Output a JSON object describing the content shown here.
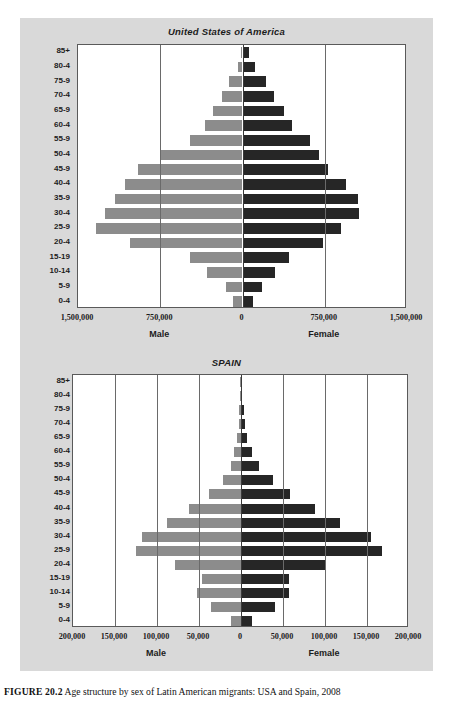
{
  "caption": {
    "label": "FIGURE 20.2",
    "text": "Age structure by sex of Latin American migrants: USA and Spain, 2008"
  },
  "colors": {
    "male_bar": "#8c8c8c",
    "female_bar": "#262626",
    "panel_background": "#d9d9d9",
    "plot_background": "#ffffff",
    "gridline": "#6a6a6a"
  },
  "chart_data": [
    {
      "type": "bar",
      "subtype": "population-pyramid",
      "title": "United States of America",
      "xlabel": "",
      "ylabel": "",
      "grid": true,
      "legend_position": "below-axis",
      "categories": [
        "85+",
        "80-4",
        "75-9",
        "70-4",
        "65-9",
        "60-4",
        "55-9",
        "50-4",
        "45-9",
        "40-4",
        "35-9",
        "30-4",
        "25-9",
        "20-4",
        "15-19",
        "10-14",
        "5-9",
        "0-4"
      ],
      "xtick_labels": [
        "1,500,000",
        "750,000",
        "0",
        "750,000",
        "1,500,000"
      ],
      "xtick_values": [
        1500000,
        750000,
        0,
        750000,
        1500000
      ],
      "xlim": [
        -1500000,
        1500000
      ],
      "series": [
        {
          "name": "Male",
          "color": "#8c8c8c",
          "side": "left",
          "values": [
            18000,
            45000,
            120000,
            185000,
            265000,
            345000,
            480000,
            740000,
            950000,
            1070000,
            1160000,
            1250000,
            1340000,
            1030000,
            480000,
            320000,
            150000,
            85000
          ]
        },
        {
          "name": "Female",
          "color": "#262626",
          "side": "right",
          "values": [
            60000,
            110000,
            210000,
            290000,
            380000,
            450000,
            620000,
            700000,
            780000,
            940000,
            1050000,
            1060000,
            900000,
            730000,
            420000,
            300000,
            175000,
            95000
          ]
        }
      ]
    },
    {
      "type": "bar",
      "subtype": "population-pyramid",
      "title": "SPAIN",
      "xlabel": "",
      "ylabel": "",
      "grid": true,
      "legend_position": "below-axis",
      "categories": [
        "85+",
        "80-4",
        "75-9",
        "70-4",
        "65-9",
        "60-4",
        "55-9",
        "50-4",
        "45-9",
        "40-4",
        "35-9",
        "30-4",
        "25-9",
        "20-4",
        "15-19",
        "10-14",
        "5-9",
        "0-4"
      ],
      "xtick_labels": [
        "200,000",
        "150,000",
        "100,000",
        "50,000",
        "0",
        "50,000",
        "100,000",
        "150,000",
        "200,000"
      ],
      "xtick_values": [
        200000,
        150000,
        100000,
        50000,
        0,
        50000,
        100000,
        150000,
        200000
      ],
      "xlim": [
        -200000,
        200000
      ],
      "series": [
        {
          "name": "Male",
          "color": "#8c8c8c",
          "side": "left",
          "values": [
            400,
            900,
            1800,
            2800,
            4200,
            8000,
            12000,
            22000,
            38000,
            62000,
            88000,
            118000,
            125000,
            78000,
            47000,
            52000,
            36000,
            12000
          ]
        },
        {
          "name": "Female",
          "color": "#262626",
          "side": "right",
          "values": [
            700,
            1400,
            3000,
            4500,
            7500,
            13000,
            22000,
            38000,
            58000,
            88000,
            118000,
            155000,
            168000,
            100000,
            57000,
            57000,
            40000,
            13000
          ]
        }
      ]
    }
  ],
  "usa_chart": {
    "title": "United States of America",
    "male_label": "Male",
    "female_label": "Female",
    "ytick_labels": [
      "85+",
      "80-4",
      "75-9",
      "70-4",
      "65-9",
      "60-4",
      "55-9",
      "50-4",
      "45-9",
      "40-4",
      "35-9",
      "30-4",
      "25-9",
      "20-4",
      "15-19",
      "10-14",
      "5-9",
      "0-4"
    ],
    "xtick_labels": [
      "1,500,000",
      "750,000",
      "0",
      "750,000",
      "1,500,000"
    ]
  },
  "spain_chart": {
    "title": "SPAIN",
    "male_label": "Male",
    "female_label": "Female",
    "ytick_labels": [
      "85+",
      "80-4",
      "75-9",
      "70-4",
      "65-9",
      "60-4",
      "55-9",
      "50-4",
      "45-9",
      "40-4",
      "35-9",
      "30-4",
      "25-9",
      "20-4",
      "15-19",
      "10-14",
      "5-9",
      "0-4"
    ],
    "xtick_labels": [
      "200,000",
      "150,000",
      "100,000",
      "50,000",
      "0",
      "50,000",
      "100,000",
      "150,000",
      "200,000"
    ]
  }
}
